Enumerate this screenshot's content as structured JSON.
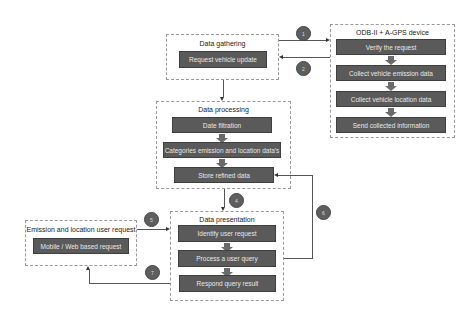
{
  "groups": {
    "gathering": {
      "title": "Data gathering",
      "steps": [
        "Request vehicle update"
      ]
    },
    "device": {
      "title": "ODB-II + A-GPS device",
      "steps": [
        "Verify the request",
        "Collect vehicle emission data",
        "Collect vehicle location data",
        "Send collected information"
      ]
    },
    "processing": {
      "title": "Data processing",
      "steps": [
        "Date filtration",
        "Categories emission and location data's",
        "Store refined data"
      ]
    },
    "user_request": {
      "title": "Emission and location user request",
      "steps": [
        "Mobile / Web based request"
      ]
    },
    "presentation": {
      "title": "Data presentation",
      "steps": [
        "Identify user request",
        "Process a user query",
        "Respond query result"
      ]
    }
  },
  "connectors": [
    {
      "id": "1",
      "label": "1",
      "from": "Data gathering",
      "to": "ODB-II + A-GPS device"
    },
    {
      "id": "2",
      "label": "2",
      "from": "ODB-II + A-GPS device",
      "to": "Data gathering"
    },
    {
      "id": "3",
      "label": "",
      "from": "Data gathering",
      "to": "Data processing"
    },
    {
      "id": "4",
      "label": "4",
      "from": "Data processing",
      "to": "Data presentation"
    },
    {
      "id": "5",
      "label": "5",
      "from": "Emission and location user request",
      "to": "Data presentation"
    },
    {
      "id": "6",
      "label": "6",
      "from": "Data presentation",
      "to": "Store refined data"
    },
    {
      "id": "7",
      "label": "7",
      "from": "Data presentation",
      "to": "Emission and location user request"
    }
  ],
  "colors": {
    "step_fill": "#5a5a5a",
    "step_text": "#e8e8e8",
    "circle_fill": "#5e5e5e",
    "border": "#9a9a9a"
  }
}
